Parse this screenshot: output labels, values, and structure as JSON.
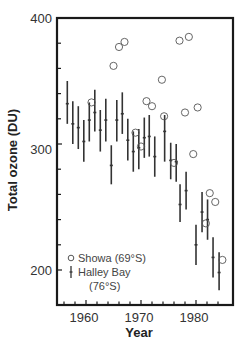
{
  "chart_data": {
    "type": "scatter",
    "title": "",
    "xlabel": "Year",
    "ylabel": "Total ozone (DU)",
    "xlim": [
      1955.5,
      1986
    ],
    "ylim": [
      185,
      400
    ],
    "x_ticks": [
      1960,
      1970,
      1980
    ],
    "y_ticks": [
      200,
      300,
      400
    ],
    "x_minor_step": 2,
    "y_minor_step": 20,
    "grid": false,
    "legend_position": "lower-left",
    "series": [
      {
        "name": "Showa (69°S)",
        "marker": "open-circle",
        "points": [
          {
            "x": 1961,
            "y": 333
          },
          {
            "x": 1965,
            "y": 362
          },
          {
            "x": 1966,
            "y": 377
          },
          {
            "x": 1967,
            "y": 381
          },
          {
            "x": 1969,
            "y": 309
          },
          {
            "x": 1970,
            "y": 298
          },
          {
            "x": 1971,
            "y": 334
          },
          {
            "x": 1972,
            "y": 330
          },
          {
            "x": 1973.8,
            "y": 351
          },
          {
            "x": 1974.2,
            "y": 322
          },
          {
            "x": 1976,
            "y": 285
          },
          {
            "x": 1977,
            "y": 382
          },
          {
            "x": 1978,
            "y": 325
          },
          {
            "x": 1978.7,
            "y": 385
          },
          {
            "x": 1979.5,
            "y": 292
          },
          {
            "x": 1980.3,
            "y": 329
          },
          {
            "x": 1981.8,
            "y": 237
          },
          {
            "x": 1982.5,
            "y": 261
          },
          {
            "x": 1983.5,
            "y": 254
          },
          {
            "x": 1984.8,
            "y": 208
          }
        ]
      },
      {
        "name": "Halley Bay (76°S)",
        "marker": "error-bar",
        "points": [
          {
            "x": 1956.6,
            "y": 332,
            "low": 316,
            "high": 350
          },
          {
            "x": 1957.6,
            "y": 316,
            "low": 300,
            "high": 334
          },
          {
            "x": 1958.6,
            "y": 313,
            "low": 296,
            "high": 330
          },
          {
            "x": 1959.6,
            "y": 302,
            "low": 286,
            "high": 319
          },
          {
            "x": 1960.6,
            "y": 319,
            "low": 302,
            "high": 333
          },
          {
            "x": 1961.6,
            "y": 325,
            "low": 310,
            "high": 343
          },
          {
            "x": 1962.6,
            "y": 311,
            "low": 294,
            "high": 327
          },
          {
            "x": 1963.6,
            "y": 319,
            "low": 302,
            "high": 336
          },
          {
            "x": 1964.6,
            "y": 283,
            "low": 268,
            "high": 299
          },
          {
            "x": 1965.6,
            "y": 319,
            "low": 302,
            "high": 335
          },
          {
            "x": 1966.6,
            "y": 324,
            "low": 308,
            "high": 341
          },
          {
            "x": 1967.6,
            "y": 303,
            "low": 287,
            "high": 320
          },
          {
            "x": 1968.6,
            "y": 294,
            "low": 278,
            "high": 310
          },
          {
            "x": 1969.6,
            "y": 297,
            "low": 280,
            "high": 312
          },
          {
            "x": 1970.6,
            "y": 305,
            "low": 289,
            "high": 321
          },
          {
            "x": 1971.5,
            "y": 306,
            "low": 290,
            "high": 323
          },
          {
            "x": 1972.5,
            "y": 290,
            "low": 274,
            "high": 306
          },
          {
            "x": 1974.3,
            "y": 310,
            "low": 286,
            "high": 323
          },
          {
            "x": 1975.4,
            "y": 287,
            "low": 272,
            "high": 301
          },
          {
            "x": 1976.4,
            "y": 286,
            "low": 270,
            "high": 300
          },
          {
            "x": 1977.1,
            "y": 252,
            "low": 238,
            "high": 268
          },
          {
            "x": 1978.2,
            "y": 263,
            "low": 248,
            "high": 278
          },
          {
            "x": 1980.0,
            "y": 220,
            "low": 204,
            "high": 236
          },
          {
            "x": 1981.1,
            "y": 246,
            "low": 230,
            "high": 262
          },
          {
            "x": 1982.1,
            "y": 240,
            "low": 224,
            "high": 256
          },
          {
            "x": 1983.1,
            "y": 210,
            "low": 194,
            "high": 226
          },
          {
            "x": 1984.2,
            "y": 198,
            "low": 184,
            "high": 214
          }
        ]
      }
    ]
  },
  "axes": {
    "x_title": "Year",
    "y_title": "Total ozone (DU)",
    "x_tick_labels": [
      "1960",
      "1970",
      "1980"
    ],
    "y_tick_labels": [
      "400",
      "300",
      "200"
    ]
  },
  "legend": {
    "showa_label": "Showa (69°S)",
    "halley_label_line1": "Halley Bay",
    "halley_label_line2": "(76°S)"
  },
  "colors": {
    "axis": "#1a1a1a",
    "bar": "#333333",
    "circle": "#555555",
    "text": "#333333"
  }
}
